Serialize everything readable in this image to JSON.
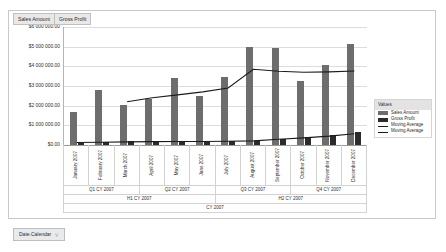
{
  "measure_pills": [
    {
      "label": "Sales Amount"
    },
    {
      "label": "Gross Profit"
    }
  ],
  "footer": {
    "label": "Date.Calendar",
    "icon": "filter-hierarchy-icon",
    "icon_glyph": "⑂"
  },
  "legend": {
    "title": "Values",
    "items": [
      {
        "label": "Sales Amount",
        "type": "bar",
        "color": "#6d6d6d"
      },
      {
        "label": "Gross Profit",
        "type": "bar",
        "color": "#2b2b2b"
      },
      {
        "label": "Moving Average",
        "type": "line",
        "color": "#1b1b1b"
      },
      {
        "label": "Moving Average",
        "type": "line",
        "color": "#1b1b1b"
      }
    ]
  },
  "axis_hierarchy": {
    "quarters": [
      "Q1 CY 2007",
      "Q2 CY 2007",
      "Q3 CY 2007",
      "Q4 CY 2007"
    ],
    "halves": [
      "H1 CY 2007",
      "H2 CY 2007"
    ],
    "year": [
      "CY 2007"
    ]
  },
  "chart_data": {
    "type": "bar",
    "title": "",
    "xlabel": "CY 2007",
    "ylabel": "",
    "ylim": [
      0,
      6000000
    ],
    "grid": true,
    "legend_position": "right",
    "categories": [
      "January 2007",
      "February 2007",
      "March 2007",
      "April 2007",
      "May 2007",
      "June 2007",
      "July 2007",
      "August 2007",
      "September 2007",
      "October 2007",
      "November 2007",
      "December 2007"
    ],
    "ytick_labels": [
      "$6 000 000.00",
      "$5 000 000.00",
      "$4 000 000.00",
      "$3 000 000.00",
      "$2 000 000.00",
      "$1 000 000.00",
      "$0.00"
    ],
    "ytick_values": [
      6000000,
      5000000,
      4000000,
      3000000,
      2000000,
      1000000,
      0
    ],
    "series": [
      {
        "name": "Sales Amount",
        "type": "bar",
        "color": "#6d6d6d",
        "values": [
          1700000,
          2800000,
          2050000,
          2350000,
          3400000,
          2500000,
          3450000,
          5000000,
          4950000,
          3250000,
          4050000,
          5150000
        ]
      },
      {
        "name": "Gross Profit",
        "type": "bar",
        "color": "#2b2b2b",
        "values": [
          110000,
          140000,
          180000,
          190000,
          170000,
          175000,
          185000,
          195000,
          330000,
          400000,
          520000,
          640000
        ]
      },
      {
        "name": "Moving Average",
        "type": "line",
        "color": "#1b1b1b",
        "values": [
          null,
          null,
          2200000,
          2400000,
          2550000,
          2700000,
          2900000,
          3850000,
          3750000,
          3700000,
          3720000,
          3760000
        ]
      },
      {
        "name": "Moving Average",
        "type": "line",
        "color": "#1b1b1b",
        "values": [
          130000,
          140000,
          160000,
          170000,
          175000,
          180000,
          190000,
          210000,
          290000,
          360000,
          450000,
          570000
        ]
      }
    ]
  }
}
